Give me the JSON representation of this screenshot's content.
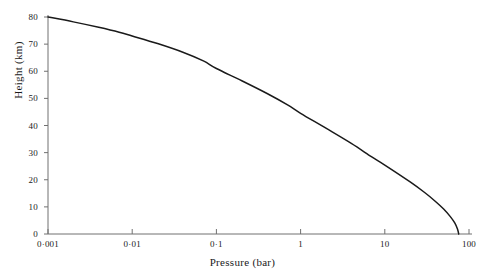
{
  "chart_data": {
    "type": "line",
    "title": "",
    "xlabel": "Pressure (bar)",
    "ylabel": "Height (km)",
    "xscale": "log",
    "yscale": "linear",
    "xlim": [
      0.001,
      100
    ],
    "ylim": [
      0,
      80
    ],
    "grid": false,
    "legend": null,
    "x_tick_values": [
      0.001,
      0.01,
      0.1,
      1,
      10,
      100
    ],
    "x_tick_labels": [
      "0·001",
      "0·01",
      "0·1",
      "1",
      "10",
      "100"
    ],
    "y_tick_values": [
      0,
      10,
      20,
      30,
      40,
      50,
      60,
      70,
      80
    ],
    "y_tick_labels": [
      "0",
      "10",
      "20",
      "30",
      "40",
      "50",
      "60",
      "70",
      "80"
    ],
    "series": [
      {
        "name": "pressure-height-profile",
        "color": "#1a1a1a",
        "line_width": 1.5,
        "points": [
          {
            "pressure": 0.001,
            "height": 80.0
          },
          {
            "pressure": 0.002,
            "height": 78.2
          },
          {
            "pressure": 0.004,
            "height": 76.2
          },
          {
            "pressure": 0.007,
            "height": 74.4
          },
          {
            "pressure": 0.01,
            "height": 73.0
          },
          {
            "pressure": 0.02,
            "height": 70.2
          },
          {
            "pressure": 0.04,
            "height": 67.0
          },
          {
            "pressure": 0.07,
            "height": 63.8
          },
          {
            "pressure": 0.1,
            "height": 61.0
          },
          {
            "pressure": 0.2,
            "height": 56.5
          },
          {
            "pressure": 0.4,
            "height": 51.8
          },
          {
            "pressure": 0.7,
            "height": 47.6
          },
          {
            "pressure": 1.0,
            "height": 44.5
          },
          {
            "pressure": 2.0,
            "height": 39.0
          },
          {
            "pressure": 4.0,
            "height": 33.4
          },
          {
            "pressure": 7.0,
            "height": 28.4
          },
          {
            "pressure": 10.0,
            "height": 25.4
          },
          {
            "pressure": 20.0,
            "height": 19.2
          },
          {
            "pressure": 30.0,
            "height": 15.2
          },
          {
            "pressure": 40.0,
            "height": 12.0
          },
          {
            "pressure": 50.0,
            "height": 9.2
          },
          {
            "pressure": 60.0,
            "height": 6.4
          },
          {
            "pressure": 68.0,
            "height": 4.0
          },
          {
            "pressure": 73.0,
            "height": 1.8
          },
          {
            "pressure": 75.5,
            "height": 0.0
          }
        ]
      }
    ]
  },
  "axes": {
    "x_title": "Pressure (bar)",
    "y_title": "Height (km)"
  },
  "style": {
    "curve_color": "#1a1a1a",
    "axis_color": "#707070",
    "background": "#ffffff"
  }
}
